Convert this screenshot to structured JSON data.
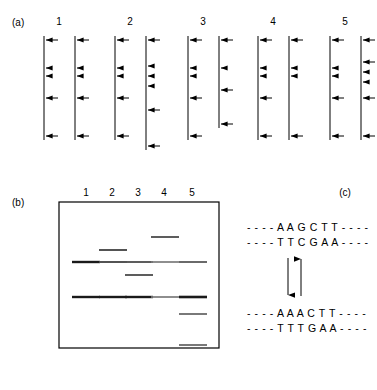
{
  "figure": {
    "panel_a_label": "(a)",
    "panel_b_label": "(b)",
    "panel_c_label": "(c)"
  },
  "panel_a": {
    "label": "(a)",
    "description": "Five pairs of linear DNA molecules with restriction-site cleavage arrows",
    "column_numbers": [
      "1",
      "2",
      "3",
      "4",
      "5"
    ],
    "pairs": [
      {
        "number": "1",
        "left_strand": {
          "top": 36,
          "bottom": 140,
          "sites": [
            40,
            68,
            76,
            98,
            136
          ]
        },
        "right_strand": {
          "top": 36,
          "bottom": 140,
          "sites": [
            40,
            68,
            76,
            98,
            136
          ]
        }
      },
      {
        "number": "2",
        "left_strand": {
          "top": 36,
          "bottom": 140,
          "sites": [
            40,
            68,
            76,
            98,
            136
          ]
        },
        "right_strand": {
          "top": 36,
          "bottom": 150,
          "sites": [
            40,
            66,
            76,
            86,
            110,
            146
          ]
        }
      },
      {
        "number": "3",
        "left_strand": {
          "top": 36,
          "bottom": 140,
          "sites": [
            40,
            68,
            76,
            98,
            136
          ]
        },
        "right_strand": {
          "top": 36,
          "bottom": 128,
          "sites": [
            40,
            68,
            90,
            124
          ]
        }
      },
      {
        "number": "4",
        "left_strand": {
          "top": 36,
          "bottom": 140,
          "sites": [
            40,
            68,
            76,
            98,
            136
          ]
        },
        "right_strand": {
          "top": 36,
          "bottom": 140,
          "sites": [
            40,
            68,
            76,
            136
          ]
        }
      },
      {
        "number": "5",
        "left_strand": {
          "top": 36,
          "bottom": 140,
          "sites": [
            40,
            68,
            76,
            98,
            136
          ]
        },
        "right_strand": {
          "top": 36,
          "bottom": 140,
          "sites": [
            40,
            62,
            70,
            80,
            98,
            136
          ]
        }
      }
    ]
  },
  "panel_b": {
    "label": "(b)",
    "description": "Agarose gel electrophoresis showing restriction fragment bands",
    "lane_numbers": [
      "1",
      "2",
      "3",
      "4",
      "5"
    ],
    "gel_box": {
      "x": 59,
      "y": 202,
      "width": 160,
      "height": 146
    },
    "lanes": [
      {
        "lane": "1",
        "x_center": 86,
        "bands": [
          {
            "y": 262,
            "intensity": "dark"
          },
          {
            "y": 297,
            "intensity": "dark"
          }
        ]
      },
      {
        "lane": "2",
        "x_center": 112,
        "bands": [
          {
            "y": 250,
            "intensity": "medium"
          },
          {
            "y": 262,
            "intensity": "medium"
          },
          {
            "y": 297,
            "intensity": "dark"
          }
        ]
      },
      {
        "lane": "3",
        "x_center": 138,
        "bands": [
          {
            "y": 262,
            "intensity": "medium"
          },
          {
            "y": 275,
            "intensity": "medium"
          },
          {
            "y": 297,
            "intensity": "dark"
          }
        ]
      },
      {
        "lane": "4",
        "x_center": 164,
        "bands": [
          {
            "y": 237,
            "intensity": "medium"
          },
          {
            "y": 262,
            "intensity": "light"
          },
          {
            "y": 297,
            "intensity": "light"
          }
        ]
      },
      {
        "lane": "5",
        "x_center": 192,
        "bands": [
          {
            "y": 262,
            "intensity": "medium"
          },
          {
            "y": 297,
            "intensity": "dark"
          },
          {
            "y": 314,
            "intensity": "medium"
          },
          {
            "y": 345,
            "intensity": "medium"
          }
        ]
      }
    ]
  },
  "panel_c": {
    "label": "(c)",
    "description": "Wild-type HindIII recognition site and mutated site, interconvertible",
    "top_duplex": {
      "strand_1": "- - - - A A G C T T - - - -",
      "strand_2": "- - - - T T C G A A - - - -"
    },
    "bottom_duplex": {
      "strand_1": "- - - - A A A C T T - - - -",
      "strand_2": "- - - - T T T G A A - - - -"
    },
    "arrows": [
      {
        "name": "forward-mutation-arrow",
        "direction": "down"
      },
      {
        "name": "reverse-mutation-arrow",
        "direction": "up"
      }
    ]
  },
  "colors": {
    "ink": "#000000",
    "band_dark": "#1a1a1a",
    "band_medium": "#555555",
    "band_light": "#8a8a8a",
    "background": "#ffffff"
  }
}
